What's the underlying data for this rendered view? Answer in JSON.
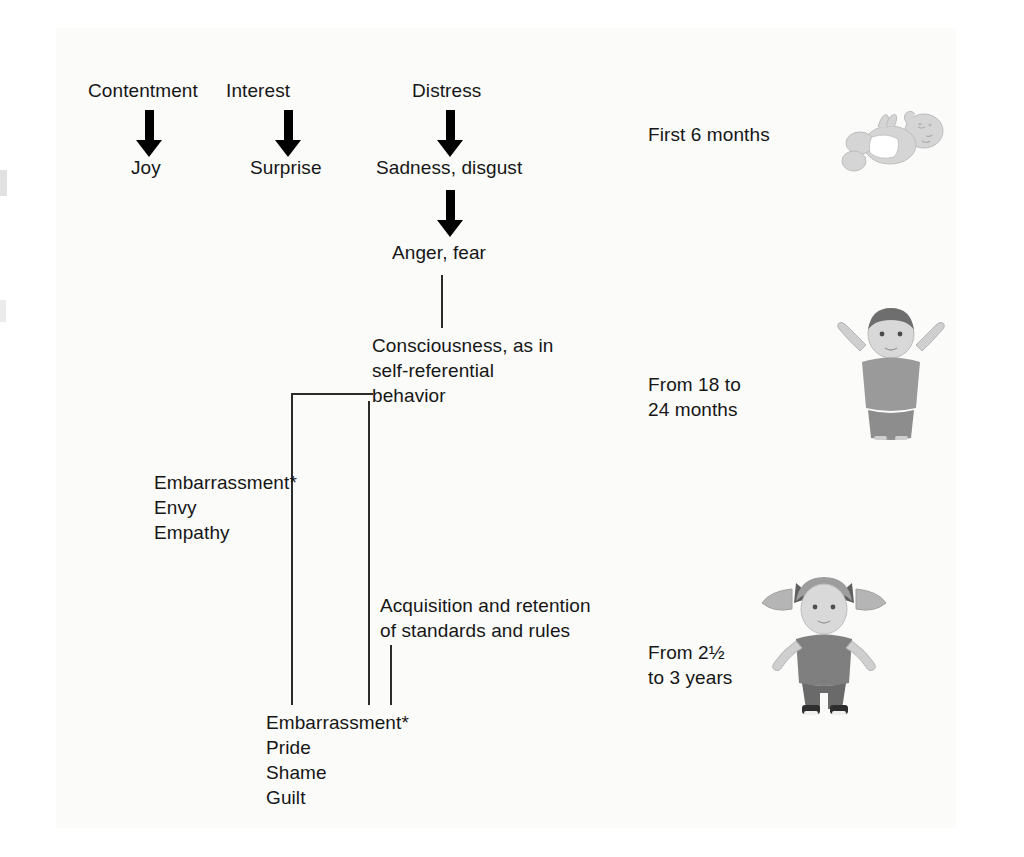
{
  "diagram": {
    "stage1": {
      "primary": [
        {
          "precursor": "Contentment",
          "emotion": "Joy"
        },
        {
          "precursor": "Interest",
          "emotion": "Surprise"
        },
        {
          "precursor": "Distress",
          "emotion": "Sadness, disgust"
        }
      ],
      "secondary": "Anger, fear",
      "age_label": "First 6 months",
      "illustration": "baby-lying-illustration"
    },
    "stage2": {
      "node": "Consciousness, as in\nself-referential\nbehavior",
      "emotions": "Embarrassment*\nEnvy\nEmpathy",
      "age_label": "From 18 to\n24 months",
      "illustration": "toddler-arms-raised-illustration"
    },
    "stage3": {
      "node": "Acquisition and retention\nof standards and rules",
      "emotions": "Embarrassment*\nPride\nShame\nGuilt",
      "age_label": "From 2½\nto 3 years",
      "illustration": "girl-pigtails-illustration"
    },
    "colors": {
      "ink": "#161616",
      "line": "#2b2b2b",
      "arrow": "#000000",
      "background": "#ffffff",
      "illustration_light": "#d9d9d9",
      "illustration_mid": "#9a9a9a",
      "illustration_dark": "#6e6e6e"
    }
  }
}
